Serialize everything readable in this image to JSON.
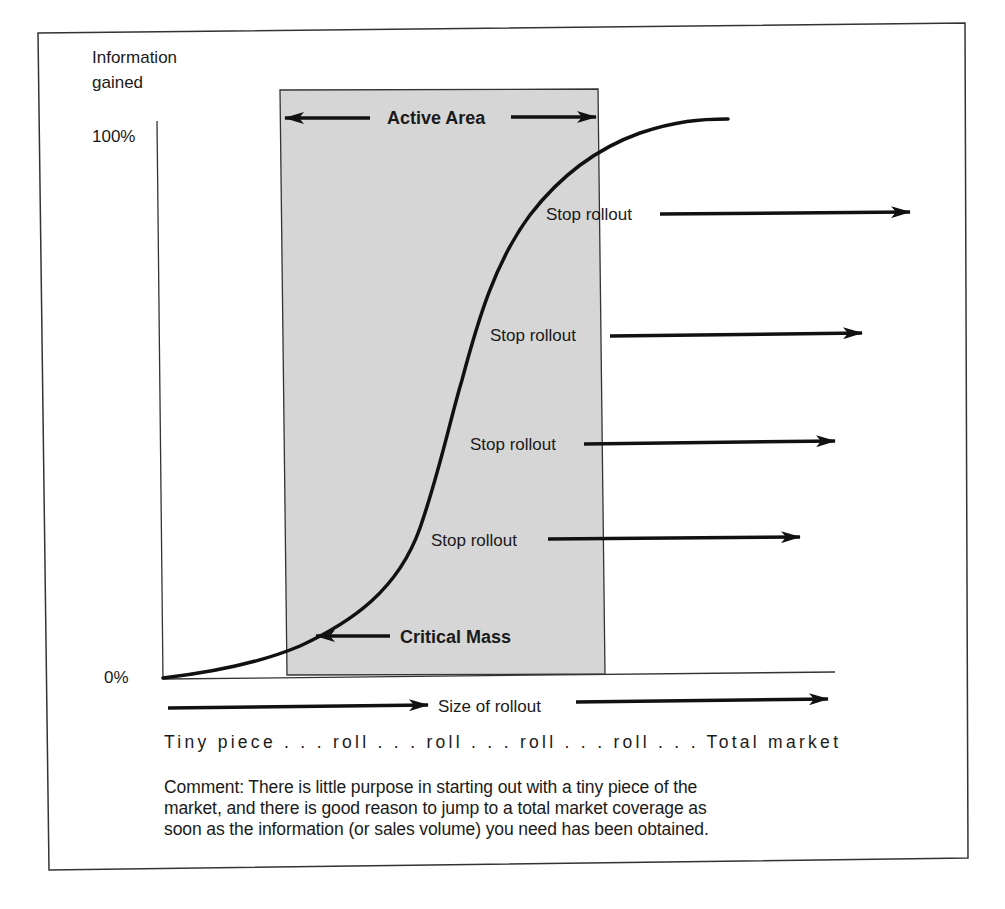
{
  "y_axis": {
    "title_line1": "Information",
    "title_line2": "gained",
    "tick_top": "100%",
    "tick_bottom": "0%"
  },
  "active_area": {
    "label": "Active Area",
    "fill": "#d6d6d6"
  },
  "critical_mass": {
    "label": "Critical Mass"
  },
  "stop_rollouts": [
    {
      "label": "Stop rollout"
    },
    {
      "label": "Stop rollout"
    },
    {
      "label": "Stop rollout"
    },
    {
      "label": "Stop rollout"
    }
  ],
  "x_axis": {
    "title": "Size of rollout",
    "scale_text": "Tiny piece . . . roll . . . roll . . . roll . . . roll . . . Total market"
  },
  "comment": {
    "line1": "Comment:  There is little purpose in starting out with a tiny piece of the",
    "line2": "market, and there is good reason to jump to a total market coverage as",
    "line3": "soon as the information (or sales volume) you need has been obtained."
  },
  "colors": {
    "ink": "#1a1a1a",
    "box_fill": "#d6d6d6",
    "frame": "#333333"
  }
}
